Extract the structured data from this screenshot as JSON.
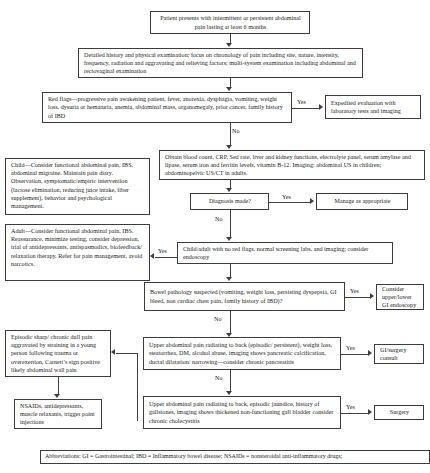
{
  "figure": {
    "abbreviations": "Abbreviations: GI = Gastrointestinal;  IBD = Inflammatory bowel disease; NSAIDs = nonsteroidal anti-inflammatory drugs;"
  },
  "nodes": {
    "presentation": "Patient presents with intermittent or persistent abdominal pain lasting at least 6 months",
    "history": "Detailed history and physical examination; focus on chronology of pain including site, nature, intensity, frequency, radiation and aggravating and relieving factors; multi-system examination including abdominal and rectovaginal examination",
    "red_flags": "Red flags—progressive pain awakening patient, fever, anorexia, dysphagia, vomiting, weight loss, dysuria or hematuria, anemia, abdominal mass, organomegaly, prior cancer, family history of IBD",
    "expedited": "Expedited evaluation with laboratory tests and imaging",
    "child": "Child—Consider functional abdominal pain, IBS, abdominal migraine. Maintain pain diary. Observation, symptomatic/empiric intervention (lactose elimination, reducing juice intake, fiber supplement), behavior and psychological management.",
    "adult": "Adult—Consider functional abdominal pain, IBS. Reassurance, minimize testing, consider depression, trial of antidepressants, antispasmodics, biofeedback/ relaxation therapy. Refer for pain management, avoid narcotics.",
    "labs": "Obtain blood count, CRP, Sed rate, liver and kidney functions, electrolyte panel, serum amylase and lipase, serum iron and ferritin levels, vitamin B-12. Imaging: abdominal US in children; abdominopelvic US/CT in adults.",
    "diagnosis_made": "Diagnosis made?",
    "manage": "Manage as appropriate",
    "no_red_flags": "Child/adult with no red flags, normal screening labs, and imaging; consider endoscopy",
    "bowel_pathology": "Bowel pathology suspected (vomiting, weight loss, persisting dyspepsia, GI bleed, non cardiac chest pain, family history of IBD)?",
    "endoscopy": "Consider upper/lower GI endoscopy",
    "abdominal_wall": "Episodic sharp/ chronic dull pain aggravated by straining in a young person following trauma or overexertion, Carnett’s sign positive likely abdominal wall pain",
    "nsaids": "NSAIDs, antidepressants, muscle relaxants, trigger point injections",
    "pancreatitis": "Upper abdominal pain radiating to back (episodic/ persistent), weight loss, steatorrhea, DM, alcohol abuse, imaging shows pancreatic calcification, ductal dilatation/ narrowing—consider chronic pancreatitis",
    "gi_surgery": "GI/surgery consult",
    "cholecystitis": "Upper abdominal pain radiating to back, episodic jaundice, history of gallstones, imaging shows thickened non-functioning gall bladder consider chronic cholecystitis",
    "surgery": "Surgery"
  },
  "edges": {
    "red_flags_yes": "Yes",
    "red_flags_no": "No",
    "diagnosis_yes": "Yes",
    "diagnosis_no": "No",
    "no_red_flags_yes": "Yes",
    "bowel_yes": "Yes",
    "bowel_no": "No",
    "pancreatitis_yes": "Yes",
    "pancreatitis_no": "No",
    "cholecystitis_yes": "Yes"
  }
}
